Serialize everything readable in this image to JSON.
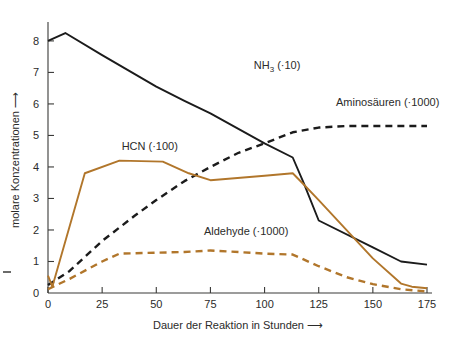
{
  "chart_data": {
    "type": "line",
    "title": "",
    "xlabel": "Dauer der Reaktion in Stunden ⟶",
    "ylabel": "molare Konzentrationen ⟶",
    "xlim": [
      0,
      175
    ],
    "ylim": [
      0,
      8.6
    ],
    "grid": false,
    "legend_position": "inline-annotations",
    "xticks": [
      "0",
      "25",
      "50",
      "75",
      "100",
      "125",
      "150",
      "175"
    ],
    "xtick_values": [
      0,
      25,
      50,
      75,
      100,
      125,
      150,
      175
    ],
    "yticks": [
      "0",
      "1",
      "2",
      "3",
      "4",
      "5",
      "6",
      "7",
      "8"
    ],
    "ytick_values": [
      0,
      1,
      2,
      3,
      4,
      5,
      6,
      7,
      8
    ],
    "series": [
      {
        "name": "NH3 (·10)",
        "label_main": "NH",
        "label_sub": "3",
        "label_tail": " (·10)",
        "color": "#1b1b1b",
        "style": "solid",
        "x": [
          0,
          8,
          25,
          50,
          63,
          75,
          100,
          113,
          118,
          125,
          150,
          163,
          175
        ],
        "y": [
          8.0,
          8.25,
          7.55,
          6.55,
          6.1,
          5.7,
          4.75,
          4.3,
          3.5,
          2.3,
          1.45,
          1.0,
          0.9
        ]
      },
      {
        "name": "Aminosäuren (·1000)",
        "label_main": "Aminosäuren (·1000)",
        "color": "#1b1b1b",
        "style": "dashed",
        "x": [
          0,
          10,
          25,
          40,
          50,
          63,
          75,
          88,
          100,
          113,
          125,
          138,
          150,
          163,
          175
        ],
        "y": [
          0.25,
          0.7,
          1.65,
          2.45,
          2.95,
          3.55,
          4.0,
          4.45,
          4.75,
          5.1,
          5.25,
          5.3,
          5.3,
          5.3,
          5.3
        ]
      },
      {
        "name": "HCN (·100)",
        "label_main": "HCN (·100)",
        "color": "#b1762b",
        "style": "solid",
        "x": [
          0,
          2,
          17,
          33,
          53,
          65,
          75,
          100,
          113,
          118,
          125,
          150,
          163,
          168,
          175
        ],
        "y": [
          0.55,
          0.2,
          3.8,
          4.2,
          4.17,
          3.8,
          3.58,
          3.72,
          3.8,
          3.45,
          2.95,
          1.1,
          0.3,
          0.2,
          0.15
        ]
      },
      {
        "name": "Aldehyde (·1000)",
        "label_main": "Aldehyde (·1000)",
        "color": "#b1762b",
        "style": "dashed",
        "x": [
          0,
          10,
          25,
          33,
          50,
          63,
          75,
          88,
          100,
          113,
          125,
          138,
          150,
          163,
          175
        ],
        "y": [
          0.12,
          0.45,
          1.0,
          1.25,
          1.28,
          1.3,
          1.35,
          1.3,
          1.25,
          1.22,
          0.85,
          0.5,
          0.28,
          0.12,
          0.05
        ]
      }
    ],
    "annotations": [
      {
        "name": "nh3-label",
        "text": "NH3 (·10)",
        "x": 95,
        "y": 7.1
      },
      {
        "name": "aminosaeuren-label",
        "text": "Aminosäuren (·1000)",
        "x": 133,
        "y": 5.95
      },
      {
        "name": "hcn-label",
        "text": "HCN (·100)",
        "x": 34,
        "y": 4.55
      },
      {
        "name": "aldehyde-label",
        "text": "Aldehyde (·1000)",
        "x": 72,
        "y": 1.85
      }
    ],
    "colors": {
      "axis": "#3a3a38",
      "text": "#2b2b2a",
      "black_series": "#1b1b1b",
      "brown_series": "#b1762b",
      "background": "#ffffff"
    }
  }
}
